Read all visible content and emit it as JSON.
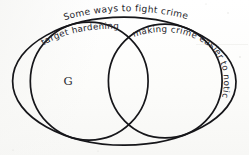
{
  "diagram": {
    "type": "venn",
    "title": "Some ways to fight crime",
    "universe_label": "Some ways to fight crime",
    "sets": [
      {
        "id": "target-hardening",
        "label": "target hardening",
        "position": "left",
        "cx": 89,
        "cy": 81,
        "r": 59
      },
      {
        "id": "making-crime-easier-to-notice",
        "label": "making crime easier to notice",
        "position": "right",
        "cx": 165,
        "cy": 81,
        "r": 57
      }
    ],
    "universe": {
      "id": "universe-ellipse",
      "cx": 124,
      "cy": 81,
      "rx": 112,
      "ry": 64
    },
    "markers": [
      {
        "id": "point-g",
        "label": "G",
        "x": 68,
        "y": 81,
        "region": "target-hardening-only"
      }
    ],
    "style": {
      "ink_color": "#16161a",
      "text_color": "#23232a",
      "paper_color": "#fdfdfb",
      "stroke_width": 1.6,
      "hand_drawn": "true"
    }
  }
}
